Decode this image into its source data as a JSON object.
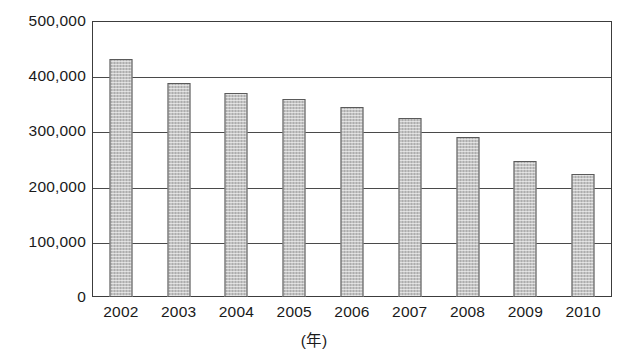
{
  "chart_data": {
    "type": "bar",
    "title": "",
    "xlabel": "(年)",
    "ylabel": "",
    "categories": [
      "2002",
      "2003",
      "2004",
      "2005",
      "2006",
      "2007",
      "2008",
      "2009",
      "2010"
    ],
    "values": [
      432000,
      388000,
      370000,
      358000,
      344000,
      325000,
      290000,
      246000,
      223000
    ],
    "ylim": [
      0,
      500000
    ],
    "yticks": [
      0,
      100000,
      200000,
      300000,
      400000,
      500000
    ],
    "ytick_labels": [
      "0",
      "100,000",
      "200,000",
      "300,000",
      "400,000",
      "500,000"
    ],
    "grid": true,
    "legend": false,
    "series_name": "",
    "bar_fill_color": "#c3c3c3",
    "bar_border_color": "#5a5a5a",
    "axis_color": "#3c3c3c",
    "background_color": "#ffffff"
  }
}
